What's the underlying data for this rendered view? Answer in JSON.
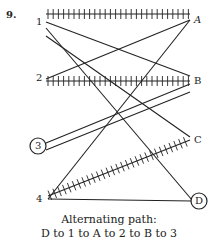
{
  "problem_number": "9.",
  "left_nodes": [
    {
      "label": "1",
      "x": 46,
      "y": 22,
      "circled": false
    },
    {
      "label": "2",
      "x": 46,
      "y": 78,
      "circled": false
    },
    {
      "label": "3",
      "x": 38,
      "y": 146,
      "circled": true
    },
    {
      "label": "4",
      "x": 46,
      "y": 200,
      "circled": false
    }
  ],
  "right_nodes": [
    {
      "label": "A",
      "x": 190,
      "y": 20,
      "circled": false
    },
    {
      "label": "B",
      "x": 190,
      "y": 80,
      "circled": false
    },
    {
      "label": "C",
      "x": 190,
      "y": 140,
      "circled": false
    },
    {
      "label": "D",
      "x": 199,
      "y": 201,
      "circled": true
    }
  ],
  "edges": [
    {
      "from": "1",
      "to": "A",
      "matched": true
    },
    {
      "from": "1",
      "to": "B",
      "matched": false
    },
    {
      "from": "1",
      "to": "C",
      "matched": false
    },
    {
      "from": "1",
      "to": "D",
      "matched": false
    },
    {
      "from": "2",
      "to": "A",
      "matched": false
    },
    {
      "from": "2",
      "to": "B",
      "matched": true
    },
    {
      "from": "3",
      "to": "B",
      "matched": false
    },
    {
      "from": "3",
      "to": "B2",
      "matched": false
    },
    {
      "from": "4",
      "to": "A",
      "matched": false
    },
    {
      "from": "4",
      "to": "C",
      "matched": true
    },
    {
      "from": "4",
      "to": "D",
      "matched": false
    }
  ],
  "caption": {
    "line1": "Alternating path:",
    "line2": "D to 1 to A to 2 to B to 3"
  }
}
